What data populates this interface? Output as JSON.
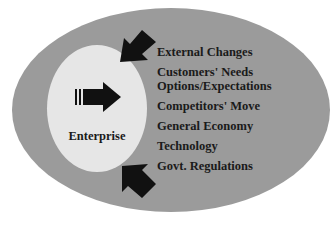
{
  "diagram": {
    "outer_region": {
      "label": "",
      "color": "#9b9b9b"
    },
    "inner_region": {
      "label": "Enterprise",
      "color": "#e6e6e6",
      "icon": "right-arrow-icon"
    },
    "inbound_arrows": [
      {
        "position": "top-left",
        "icon": "inbound-arrow-icon"
      },
      {
        "position": "bottom-left",
        "icon": "inbound-arrow-icon"
      }
    ],
    "factors": [
      "External Changes",
      "Customers' Needs Options/Expectations",
      "Competitors' Move",
      "General Economy",
      "Technology",
      "Govt. Regulations"
    ],
    "factor_lines": {
      "f0": "External Changes",
      "f1a": "Customers' Needs",
      "f1b": "Options/Expectations",
      "f2": "Competitors' Move",
      "f3": "General Economy",
      "f4": "Technology",
      "f5": "Govt. Regulations"
    }
  }
}
